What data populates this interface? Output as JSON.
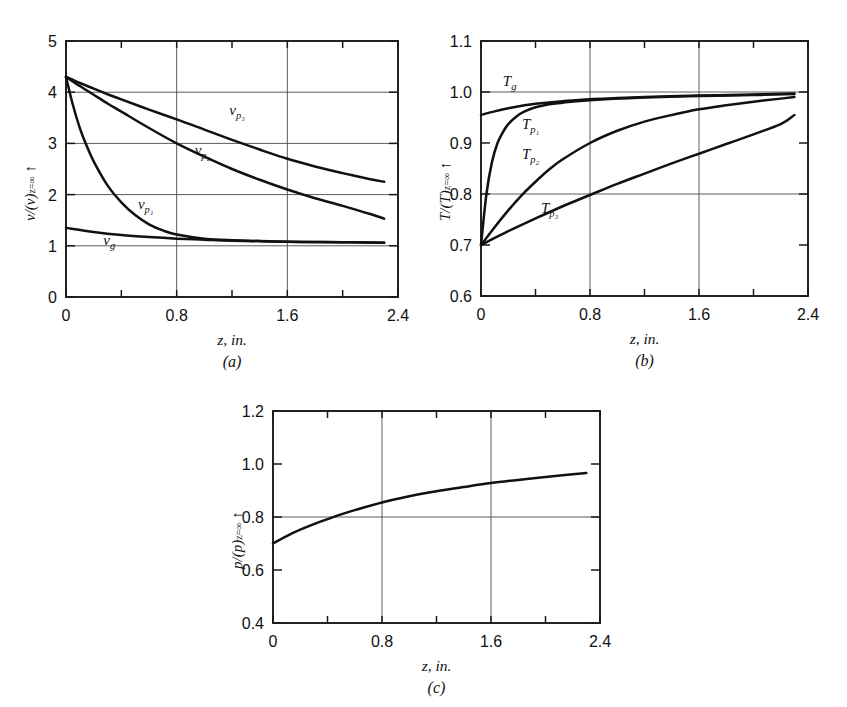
{
  "figure": {
    "background": "#ffffff",
    "ink": "#111111",
    "grid_color": "#4a4a4a"
  },
  "chart_data": [
    {
      "id": "a",
      "type": "line",
      "panel_label": "(a)",
      "title": "",
      "xlabel": "z, in.",
      "ylabel": "v/(v)",
      "ylabel_sub": "z=∞",
      "ylabel_arrow": "↑",
      "xlim": [
        0,
        2.4
      ],
      "ylim": [
        0,
        5
      ],
      "xticks": [
        0,
        0.8,
        1.6,
        2.4
      ],
      "xticklabels": [
        "0",
        "0.8",
        "1.6",
        "2.4"
      ],
      "xminorticks": [
        0.4,
        1.2,
        2.0
      ],
      "yticks": [
        0,
        1,
        2,
        3,
        4,
        5
      ],
      "yticklabels": [
        "0",
        "1",
        "2",
        "3",
        "4",
        "5"
      ],
      "gridlines_x": [
        0.8,
        1.6
      ],
      "gridlines_y": [
        1,
        2,
        3,
        4
      ],
      "grid": true,
      "legend_position": "inline-annotations",
      "series": [
        {
          "name": "v_p3",
          "label": "v",
          "label_sub": "p₃",
          "label_at": [
            1.18,
            3.55
          ],
          "x": [
            0,
            0.1,
            0.2,
            0.3,
            0.4,
            0.6,
            0.8,
            1.0,
            1.2,
            1.4,
            1.6,
            1.8,
            2.0,
            2.2,
            2.3
          ],
          "y": [
            4.3,
            4.18,
            4.07,
            3.96,
            3.86,
            3.66,
            3.47,
            3.27,
            3.07,
            2.88,
            2.7,
            2.55,
            2.42,
            2.3,
            2.25
          ]
        },
        {
          "name": "v_p2",
          "label": "v",
          "label_sub": "p₂",
          "label_at": [
            0.93,
            2.78
          ],
          "x": [
            0,
            0.1,
            0.2,
            0.3,
            0.4,
            0.6,
            0.8,
            1.0,
            1.2,
            1.4,
            1.6,
            1.8,
            2.0,
            2.2,
            2.3
          ],
          "y": [
            4.3,
            4.12,
            3.95,
            3.78,
            3.62,
            3.3,
            3.0,
            2.74,
            2.5,
            2.29,
            2.1,
            1.93,
            1.78,
            1.62,
            1.53
          ]
        },
        {
          "name": "v_p1",
          "label": "v",
          "label_sub": "p₁",
          "label_at": [
            0.52,
            1.72
          ],
          "x": [
            0,
            0.05,
            0.1,
            0.15,
            0.2,
            0.3,
            0.4,
            0.5,
            0.6,
            0.7,
            0.8,
            1.0,
            1.2,
            1.6,
            2.0,
            2.3
          ],
          "y": [
            4.3,
            3.75,
            3.3,
            2.95,
            2.65,
            2.18,
            1.85,
            1.6,
            1.42,
            1.3,
            1.22,
            1.14,
            1.11,
            1.08,
            1.07,
            1.06
          ]
        },
        {
          "name": "v_g",
          "label": "v",
          "label_sub": "g",
          "label_at": [
            0.27,
            1.02
          ],
          "x": [
            0,
            0.2,
            0.4,
            0.6,
            0.8,
            1.0,
            1.2,
            1.6,
            2.0,
            2.3
          ],
          "y": [
            1.35,
            1.27,
            1.21,
            1.17,
            1.14,
            1.12,
            1.1,
            1.08,
            1.07,
            1.06
          ]
        }
      ]
    },
    {
      "id": "b",
      "type": "line",
      "panel_label": "(b)",
      "title": "",
      "xlabel": "z, in.",
      "ylabel": "T/(T)",
      "ylabel_sub": "z=∞",
      "ylabel_arrow": "↑",
      "xlim": [
        0,
        2.4
      ],
      "ylim": [
        0.6,
        1.1
      ],
      "xticks": [
        0,
        0.8,
        1.6,
        2.4
      ],
      "xticklabels": [
        "0",
        "0.8",
        "1.6",
        "2.4"
      ],
      "xminorticks": [
        0.4,
        1.2,
        2.0
      ],
      "yticks": [
        0.6,
        0.7,
        0.8,
        0.9,
        1.0,
        1.1
      ],
      "yticklabels": [
        "0.6",
        "0.7",
        "0.8",
        "0.9",
        "1.0",
        "1.1"
      ],
      "gridlines_x": [
        0.8,
        1.6
      ],
      "gridlines_y": [
        0.8,
        1.0
      ],
      "grid": true,
      "legend_position": "inline-annotations",
      "series": [
        {
          "name": "T_g",
          "label": "T",
          "label_sub": "g",
          "label_at": [
            0.16,
            1.012
          ],
          "x": [
            0,
            0.1,
            0.2,
            0.3,
            0.4,
            0.6,
            0.8,
            1.0,
            1.2,
            1.6,
            2.0,
            2.3
          ],
          "y": [
            0.955,
            0.962,
            0.968,
            0.973,
            0.977,
            0.982,
            0.986,
            0.988,
            0.99,
            0.993,
            0.995,
            0.997
          ]
        },
        {
          "name": "T_p1",
          "label": "T",
          "label_sub": "p₁",
          "label_at": [
            0.3,
            0.928
          ],
          "x": [
            0,
            0.04,
            0.08,
            0.12,
            0.16,
            0.2,
            0.26,
            0.32,
            0.4,
            0.5,
            0.6,
            0.8,
            1.2,
            1.6,
            2.0,
            2.3
          ],
          "y": [
            0.7,
            0.8,
            0.862,
            0.899,
            0.921,
            0.937,
            0.952,
            0.962,
            0.97,
            0.976,
            0.979,
            0.984,
            0.989,
            0.992,
            0.994,
            0.996
          ]
        },
        {
          "name": "T_p2",
          "label": "T",
          "label_sub": "p₂",
          "label_at": [
            0.3,
            0.868
          ],
          "x": [
            0,
            0.1,
            0.2,
            0.3,
            0.4,
            0.5,
            0.6,
            0.8,
            1.0,
            1.2,
            1.4,
            1.6,
            1.8,
            2.0,
            2.2,
            2.3
          ],
          "y": [
            0.7,
            0.735,
            0.768,
            0.798,
            0.824,
            0.848,
            0.868,
            0.9,
            0.924,
            0.942,
            0.955,
            0.966,
            0.974,
            0.981,
            0.987,
            0.99
          ]
        },
        {
          "name": "T_p3",
          "label": "T",
          "label_sub": "p₃",
          "label_at": [
            0.44,
            0.762
          ],
          "x": [
            0,
            0.2,
            0.4,
            0.6,
            0.8,
            1.0,
            1.2,
            1.4,
            1.6,
            1.8,
            2.0,
            2.2,
            2.3
          ],
          "y": [
            0.7,
            0.727,
            0.752,
            0.776,
            0.798,
            0.82,
            0.84,
            0.86,
            0.879,
            0.898,
            0.917,
            0.937,
            0.955
          ]
        }
      ]
    },
    {
      "id": "c",
      "type": "line",
      "panel_label": "(c)",
      "title": "",
      "xlabel": "z, in.",
      "ylabel": "p/(p)",
      "ylabel_sub": "z=∞",
      "ylabel_arrow": "↑",
      "xlim": [
        0,
        2.4
      ],
      "ylim": [
        0.4,
        1.2
      ],
      "xticks": [
        0,
        0.8,
        1.6,
        2.4
      ],
      "xticklabels": [
        "0",
        "0.8",
        "1.6",
        "2.4"
      ],
      "xminorticks": [
        0.4,
        1.2,
        2.0
      ],
      "yticks": [
        0.4,
        0.6,
        0.8,
        1.0,
        1.2
      ],
      "yticklabels": [
        "0.4",
        "0.6",
        "0.8",
        "1.0",
        "1.2"
      ],
      "gridlines_x": [
        0.8,
        1.6
      ],
      "gridlines_y": [
        0.8
      ],
      "grid": true,
      "legend_position": "none",
      "series": [
        {
          "name": "p",
          "label": "",
          "label_sub": "",
          "label_at": [
            0,
            0
          ],
          "x": [
            0,
            0.1,
            0.2,
            0.3,
            0.4,
            0.5,
            0.6,
            0.8,
            1.0,
            1.2,
            1.4,
            1.6,
            1.8,
            2.0,
            2.2,
            2.3
          ],
          "y": [
            0.7,
            0.728,
            0.752,
            0.773,
            0.792,
            0.81,
            0.826,
            0.855,
            0.878,
            0.897,
            0.913,
            0.928,
            0.94,
            0.951,
            0.961,
            0.966
          ]
        }
      ]
    }
  ]
}
